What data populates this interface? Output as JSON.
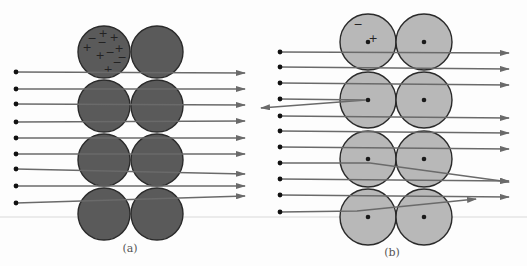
{
  "figure": {
    "panels": [
      {
        "id": "a",
        "caption": "(a)",
        "caption_pos": [
          130,
          252
        ],
        "atom_color": "#5a5a5a",
        "atom_radius": 26,
        "atoms": [
          {
            "cx": 104,
            "cy": 52
          },
          {
            "cx": 157,
            "cy": 52
          },
          {
            "cx": 104,
            "cy": 106
          },
          {
            "cx": 157,
            "cy": 106
          },
          {
            "cx": 104,
            "cy": 160
          },
          {
            "cx": 157,
            "cy": 160
          },
          {
            "cx": 104,
            "cy": 214
          },
          {
            "cx": 157,
            "cy": 214
          }
        ],
        "show_nucleus": false,
        "charges": [
          {
            "s": "+",
            "x": 103,
            "y": 37
          },
          {
            "s": "+",
            "x": 114,
            "y": 41
          },
          {
            "s": "+",
            "x": 87,
            "y": 51
          },
          {
            "s": "+",
            "x": 100,
            "y": 59
          },
          {
            "s": "+",
            "x": 119,
            "y": 52
          },
          {
            "s": "+",
            "x": 108,
            "y": 73
          },
          {
            "s": "−",
            "x": 92,
            "y": 42
          },
          {
            "s": "−",
            "x": 102,
            "y": 46
          },
          {
            "s": "−",
            "x": 110,
            "y": 56
          },
          {
            "s": "−",
            "x": 122,
            "y": 61
          },
          {
            "s": "−",
            "x": 117,
            "y": 66
          }
        ],
        "rays": [
          {
            "pts": [
              [
                16,
                72
              ],
              [
                245,
                73
              ]
            ]
          },
          {
            "pts": [
              [
                16,
                89
              ],
              [
                245,
                89
              ]
            ]
          },
          {
            "pts": [
              [
                16,
                104
              ],
              [
                245,
                105
              ]
            ]
          },
          {
            "pts": [
              [
                16,
                122
              ],
              [
                245,
                121
              ]
            ]
          },
          {
            "pts": [
              [
                16,
                138
              ],
              [
                245,
                138
              ]
            ]
          },
          {
            "pts": [
              [
                16,
                154
              ],
              [
                245,
                154
              ]
            ]
          },
          {
            "pts": [
              [
                16,
                169
              ],
              [
                245,
                174
              ]
            ]
          },
          {
            "pts": [
              [
                16,
                186
              ],
              [
                245,
                186
              ]
            ]
          },
          {
            "pts": [
              [
                16,
                203
              ],
              [
                245,
                196
              ]
            ]
          }
        ]
      },
      {
        "id": "b",
        "caption": "(b)",
        "caption_pos": [
          392,
          256
        ],
        "atom_color": "#b8b8b8",
        "atom_radius": 28,
        "atoms": [
          {
            "cx": 368,
            "cy": 42
          },
          {
            "cx": 424,
            "cy": 42
          },
          {
            "cx": 368,
            "cy": 100
          },
          {
            "cx": 424,
            "cy": 100
          },
          {
            "cx": 368,
            "cy": 159
          },
          {
            "cx": 424,
            "cy": 159
          },
          {
            "cx": 368,
            "cy": 217
          },
          {
            "cx": 424,
            "cy": 217
          }
        ],
        "show_nucleus": true,
        "charges": [
          {
            "s": "−",
            "x": 358,
            "y": 28
          },
          {
            "s": "+",
            "x": 373,
            "y": 42
          }
        ],
        "rays": [
          {
            "pts": [
              [
                280,
                52
              ],
              [
                509,
                53
              ]
            ]
          },
          {
            "pts": [
              [
                280,
                67
              ],
              [
                509,
                69
              ]
            ]
          },
          {
            "pts": [
              [
                280,
                83
              ],
              [
                509,
                85
              ]
            ]
          },
          {
            "pts": [
              [
                280,
                99
              ],
              [
                366,
                100
              ],
              [
                261,
                108
              ]
            ]
          },
          {
            "pts": [
              [
                280,
                116
              ],
              [
                509,
                118
              ]
            ]
          },
          {
            "pts": [
              [
                280,
                131
              ],
              [
                509,
                133
              ]
            ]
          },
          {
            "pts": [
              [
                280,
                147
              ],
              [
                509,
                149
              ]
            ]
          },
          {
            "pts": [
              [
                280,
                163
              ],
              [
                370,
                163
              ],
              [
                509,
                182
              ]
            ]
          },
          {
            "pts": [
              [
                280,
                179
              ],
              [
                509,
                181
              ]
            ]
          },
          {
            "pts": [
              [
                280,
                195
              ],
              [
                509,
                197
              ]
            ]
          },
          {
            "pts": [
              [
                280,
                212
              ],
              [
                357,
                211
              ],
              [
                476,
                199
              ]
            ]
          }
        ]
      }
    ],
    "ray_color": "#6a6a6a",
    "baseline": {
      "y": 217,
      "color": "#d9d9d9"
    }
  }
}
